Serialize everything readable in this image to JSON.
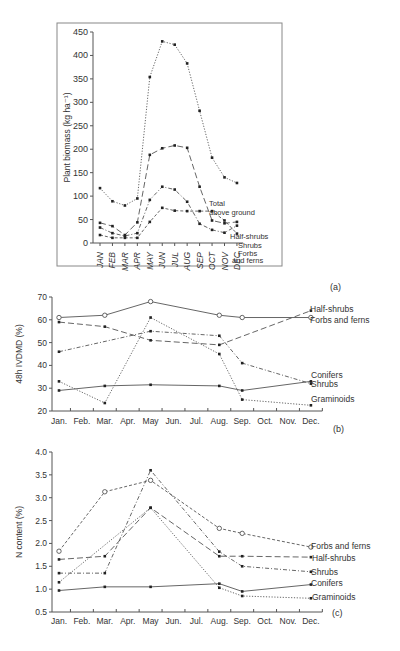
{
  "chart_data": [
    {
      "panel": "(a)",
      "type": "line",
      "title": "",
      "xlabel": "",
      "ylabel": "Plant biomass (kg ha⁻¹)",
      "ylim": [
        0,
        450
      ],
      "yticks": [
        0,
        50,
        100,
        150,
        200,
        250,
        300,
        350,
        400,
        450
      ],
      "categories": [
        "JAN",
        "FEB",
        "MAR",
        "APR",
        "MAY",
        "JUN",
        "JUL",
        "AUG",
        "SEP",
        "OCT",
        "NOV",
        "DEC"
      ],
      "grid": false,
      "series": [
        {
          "name": "Total above ground",
          "style": "dotted",
          "x": [
            "JAN",
            "FEB",
            "MAR",
            "APR",
            "MAY",
            "JUN",
            "JUL",
            "AUG",
            "SEP",
            "OCT",
            "NOV",
            "DEC"
          ],
          "values": [
            117,
            89,
            80,
            95,
            354,
            430,
            423,
            383,
            282,
            182,
            140,
            128
          ]
        },
        {
          "name": "Half-shrubs",
          "style": "long-dash",
          "x": [
            "JAN",
            "FEB",
            "MAR",
            "APR",
            "MAY",
            "JUN",
            "JUL",
            "AUG",
            "SEP",
            "OCT",
            "NOV",
            "DEC"
          ],
          "values": [
            43,
            36,
            17,
            44,
            188,
            202,
            208,
            203,
            120,
            48,
            42,
            45
          ]
        },
        {
          "name": "Shrubs",
          "style": "dash-dot",
          "x": [
            "JAN",
            "FEB",
            "MAR",
            "APR",
            "MAY",
            "JUN",
            "JUL",
            "AUG",
            "SEP",
            "OCT",
            "NOV",
            "DEC"
          ],
          "values": [
            33,
            21,
            15,
            21,
            92,
            120,
            114,
            88,
            41,
            28,
            22,
            37
          ]
        },
        {
          "name": "Forbs and ferns",
          "style": "short-dash",
          "x": [
            "JAN",
            "FEB",
            "MAR",
            "APR",
            "MAY",
            "JUN",
            "JUL",
            "AUG",
            "SEP",
            "OCT",
            "NOV",
            "DEC"
          ],
          "values": [
            17,
            11,
            11,
            11,
            45,
            75,
            69,
            68,
            68,
            68,
            48,
            20
          ]
        }
      ],
      "annotations": [
        "Total above ground",
        "Half-shrubs",
        "Shrubs",
        "Forbs and ferns"
      ]
    },
    {
      "panel": "(b)",
      "type": "line",
      "title": "",
      "xlabel": "",
      "ylabel": "48h IVDMD (%)",
      "ylim": [
        20,
        70
      ],
      "yticks": [
        20,
        30,
        40,
        50,
        60,
        70
      ],
      "categories": [
        "Jan.",
        "Feb.",
        "Mar.",
        "Apr.",
        "May",
        "Jun.",
        "Jul.",
        "Aug.",
        "Sep.",
        "Oct.",
        "Nov.",
        "Dec."
      ],
      "grid": false,
      "series": [
        {
          "name": "Half-shrubs",
          "style": "long-dash",
          "marker": "filled",
          "x": [
            "Jan.",
            "Mar.",
            "May",
            "Aug.",
            "Dec."
          ],
          "values": [
            59,
            57,
            51,
            49,
            64
          ]
        },
        {
          "name": "Forbs and ferns",
          "style": "solid",
          "marker": "open",
          "x": [
            "Jan.",
            "Mar.",
            "May",
            "Aug.",
            "Sep.",
            "Dec."
          ],
          "values": [
            61,
            62,
            68,
            62,
            61,
            61
          ]
        },
        {
          "name": "Conifers",
          "style": "dash-dot",
          "marker": "filled",
          "x": [
            "Jan.",
            "May",
            "Aug.",
            "Sep.",
            "Dec."
          ],
          "values": [
            46,
            55,
            53,
            41,
            32
          ]
        },
        {
          "name": "Shrubs",
          "style": "solid",
          "marker": "filled",
          "x": [
            "Jan.",
            "Mar.",
            "May",
            "Aug.",
            "Sep.",
            "Dec."
          ],
          "values": [
            29,
            31,
            31.5,
            31,
            29,
            33
          ]
        },
        {
          "name": "Graminoids",
          "style": "dotted",
          "marker": "filled",
          "x": [
            "Jan.",
            "Mar.",
            "May",
            "Aug.",
            "Sep.",
            "Dec."
          ],
          "values": [
            33,
            23.5,
            61,
            45,
            25,
            22.5
          ]
        }
      ],
      "legend_labels": [
        "Half-shrubs",
        "Forbs and ferns",
        "Conifers",
        "Shrubs",
        "Graminoids"
      ]
    },
    {
      "panel": "(c)",
      "type": "line",
      "title": "",
      "xlabel": "",
      "ylabel": "N content (%)",
      "ylim": [
        0.5,
        4.0
      ],
      "yticks": [
        0.5,
        1.0,
        1.5,
        2.0,
        2.5,
        3.0,
        3.5,
        4.0
      ],
      "categories": [
        "Jan.",
        "Feb.",
        "Mar.",
        "Apr.",
        "May",
        "Jun.",
        "Jul.",
        "Aug.",
        "Sep.",
        "Oct.",
        "Nov.",
        "Dec."
      ],
      "grid": false,
      "series": [
        {
          "name": "Forbs and ferns",
          "style": "short-dash",
          "marker": "open",
          "x": [
            "Jan.",
            "Mar.",
            "May",
            "Aug.",
            "Sep.",
            "Dec."
          ],
          "values": [
            1.83,
            3.13,
            3.38,
            2.33,
            2.22,
            1.92
          ]
        },
        {
          "name": "Half-shrubs",
          "style": "long-dash",
          "marker": "filled",
          "x": [
            "Jan.",
            "Mar.",
            "May",
            "Aug.",
            "Sep.",
            "Dec."
          ],
          "values": [
            1.65,
            1.72,
            2.78,
            1.72,
            1.72,
            1.7
          ]
        },
        {
          "name": "Shrubs",
          "style": "dash-dot",
          "marker": "filled",
          "x": [
            "Jan.",
            "Mar.",
            "May",
            "Aug.",
            "Sep.",
            "Dec."
          ],
          "values": [
            1.35,
            1.35,
            3.6,
            1.82,
            1.5,
            1.38
          ]
        },
        {
          "name": "Conifers",
          "style": "solid",
          "marker": "filled",
          "x": [
            "Jan.",
            "Mar.",
            "May",
            "Aug.",
            "Sep.",
            "Dec."
          ],
          "values": [
            0.97,
            1.05,
            1.05,
            1.12,
            0.95,
            1.1
          ]
        },
        {
          "name": "Graminoids",
          "style": "dotted",
          "marker": "filled",
          "x": [
            "Jan.",
            "May",
            "Aug.",
            "Sep.",
            "Dec."
          ],
          "values": [
            1.15,
            2.78,
            1.03,
            0.85,
            0.8
          ]
        }
      ],
      "legend_labels": [
        "Forbs and ferns",
        "Half-shrubs",
        "Shrubs",
        "Conifers",
        "Graminoids"
      ]
    }
  ],
  "panel_labels": {
    "a": "(a)",
    "b": "(b)",
    "c": "(c)"
  }
}
